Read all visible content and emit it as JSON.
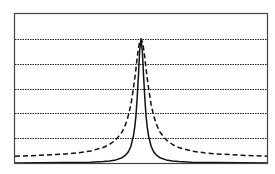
{
  "chart_data": {
    "type": "line",
    "title": "",
    "xlabel": "",
    "ylabel": "",
    "xlim": [
      -1,
      1
    ],
    "ylim": [
      0,
      1.2
    ],
    "grid": {
      "horizontal": true,
      "vertical": false,
      "style": "dotted",
      "y_values": [
        0.2,
        0.4,
        0.6,
        0.8,
        1.0
      ]
    },
    "legend": null,
    "x": [
      -1.0,
      -0.8,
      -0.6,
      -0.5,
      -0.4,
      -0.3,
      -0.25,
      -0.2,
      -0.15,
      -0.12,
      -0.1,
      -0.08,
      -0.06,
      -0.05,
      -0.04,
      -0.03,
      -0.02,
      -0.01,
      0.0,
      0.01,
      0.02,
      0.03,
      0.04,
      0.05,
      0.06,
      0.08,
      0.1,
      0.12,
      0.15,
      0.2,
      0.25,
      0.3,
      0.4,
      0.5,
      0.6,
      0.8,
      1.0
    ],
    "series": [
      {
        "name": "narrow (solid)",
        "style": "solid",
        "color": "#000000",
        "values": [
          0.001,
          0.002,
          0.003,
          0.004,
          0.006,
          0.011,
          0.016,
          0.025,
          0.043,
          0.066,
          0.091,
          0.135,
          0.217,
          0.286,
          0.385,
          0.526,
          0.714,
          0.909,
          1.0,
          0.909,
          0.714,
          0.526,
          0.385,
          0.286,
          0.217,
          0.135,
          0.091,
          0.066,
          0.043,
          0.025,
          0.016,
          0.011,
          0.006,
          0.004,
          0.003,
          0.002,
          0.001
        ]
      },
      {
        "name": "wide (dashed)",
        "style": "dashed",
        "color": "#000000",
        "values": [
          0.055,
          0.062,
          0.073,
          0.082,
          0.097,
          0.125,
          0.149,
          0.186,
          0.25,
          0.318,
          0.385,
          0.47,
          0.6,
          0.68,
          0.764,
          0.851,
          0.928,
          0.98,
          1.0,
          0.98,
          0.928,
          0.851,
          0.764,
          0.68,
          0.6,
          0.47,
          0.385,
          0.318,
          0.25,
          0.186,
          0.149,
          0.125,
          0.097,
          0.082,
          0.073,
          0.062,
          0.055
        ]
      }
    ]
  },
  "colors": {
    "frame": "#444444",
    "grid": "#222222",
    "line": "#111111",
    "background": "#ffffff"
  }
}
